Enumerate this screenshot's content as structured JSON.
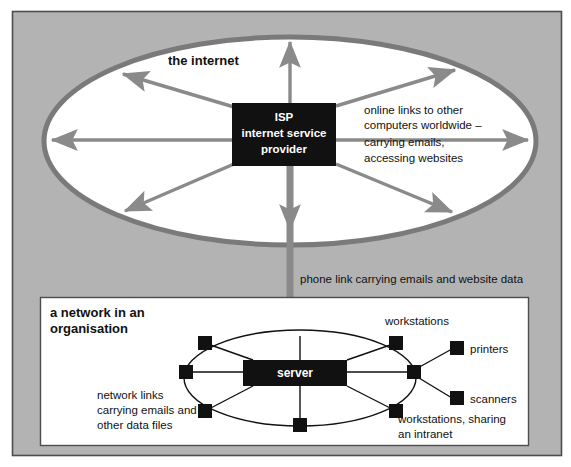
{
  "canvas": {
    "width": 571,
    "height": 467
  },
  "colors": {
    "frame_fill": "#b3b3b3",
    "frame_border": "#4d4d4d",
    "ellipse_fill": "#ffffff",
    "ellipse_stroke": "#7a7a7a",
    "arrow_gray": "#8a8a8a",
    "node_black": "#111111",
    "inner_panel_fill": "#ffffff",
    "inner_panel_border": "#4d4d4d",
    "link_line": "#111111",
    "text": "#111111",
    "box_text": "#ffffff"
  },
  "internet": {
    "title": "the internet",
    "isp_box": {
      "line1": "ISP",
      "line2": "internet service",
      "line3": "provider"
    },
    "annotation": [
      "online links to other",
      "computers worldwide –",
      "carrying emails,",
      "accessing websites"
    ]
  },
  "phone_link": {
    "caption": "phone link carrying emails and website data"
  },
  "organisation": {
    "title": [
      "a network in an",
      "organisation"
    ],
    "server_label": "server",
    "labels": {
      "workstations_top": "workstations",
      "printers": "printers",
      "scanners": "scanners",
      "workstations_intranet": [
        "workstations, sharing",
        "an intranet"
      ],
      "network_links": [
        "network links",
        "carrying emails and",
        "other data files"
      ]
    },
    "node_count": 6,
    "peripheral_count": 2
  }
}
